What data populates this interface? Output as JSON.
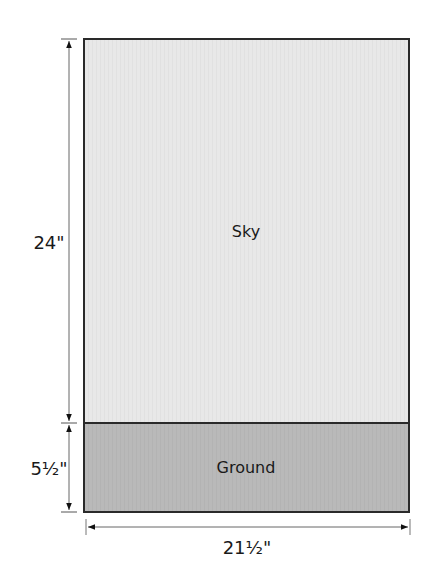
{
  "diagram": {
    "type": "quilt-layout",
    "sections": {
      "sky": {
        "label": "Sky",
        "fill": "#e8e8e8"
      },
      "ground": {
        "label": "Ground",
        "fill": "#b8b8b8"
      }
    },
    "dimensions": {
      "sky_height": "24\"",
      "ground_height": "5½\"",
      "total_width": "21½\""
    },
    "colors": {
      "border": "#2a2a2a",
      "dimension_line": "#555555",
      "text": "#1a1a1a"
    }
  }
}
